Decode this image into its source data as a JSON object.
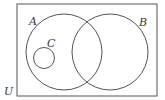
{
  "diagram": {
    "type": "venn",
    "colors": {
      "background": "#ffffff",
      "stroke": "#555555",
      "label": "#3a3a3a"
    },
    "universe": {
      "label": "U",
      "x": 17,
      "y": 4,
      "width": 140,
      "height": 92,
      "label_x": 4,
      "label_y": 95
    },
    "sets": [
      {
        "id": "A",
        "label": "A",
        "cx": 64,
        "cy": 52,
        "r": 38,
        "label_x": 29,
        "label_y": 25
      },
      {
        "id": "B",
        "label": "B",
        "cx": 110,
        "cy": 52,
        "r": 38,
        "label_x": 139,
        "label_y": 26
      },
      {
        "id": "C",
        "label": "C",
        "cx": 44,
        "cy": 58,
        "r": 10.5,
        "label_x": 47,
        "label_y": 47
      }
    ],
    "relations": [
      "C is a subset of A",
      "C is disjoint from B",
      "A and B overlap"
    ]
  }
}
